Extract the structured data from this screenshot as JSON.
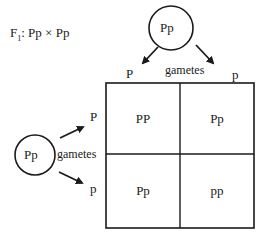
{
  "title": {
    "generation": "F",
    "subscript": "1",
    "cross": ": Pp × Pp"
  },
  "top_parent": {
    "genotype": "Pp",
    "gametes_label": "gametes",
    "gametes": [
      "P",
      "p"
    ]
  },
  "left_parent": {
    "genotype": "Pp",
    "gametes_label": "gametes",
    "gametes": [
      "P",
      "p"
    ]
  },
  "punnett_square": {
    "rows": [
      [
        "PP",
        "Pp"
      ],
      [
        "Pp",
        "pp"
      ]
    ]
  }
}
